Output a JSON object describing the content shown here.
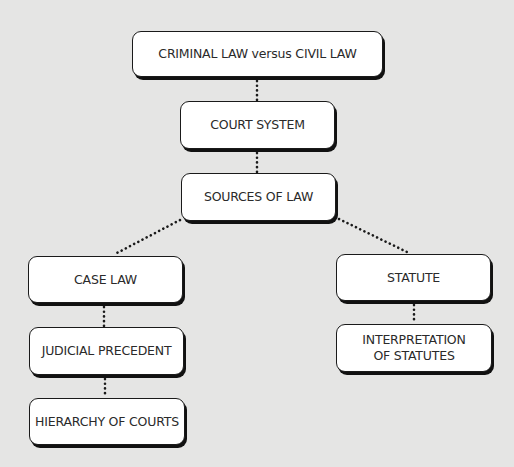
{
  "diagram": {
    "title": "",
    "background_color": "#e5e5e4",
    "node_fill": "#ffffff",
    "node_border": "#1a1a1a",
    "connector_color": "#1a1a1a",
    "connector_style": "dotted",
    "nodes": [
      {
        "id": "criminal-vs-civil",
        "label": "CRIMINAL LAW versus CIVIL LAW"
      },
      {
        "id": "court-system",
        "label": "COURT SYSTEM"
      },
      {
        "id": "sources-of-law",
        "label": "SOURCES OF LAW"
      },
      {
        "id": "case-law",
        "label": "CASE LAW"
      },
      {
        "id": "statute",
        "label": "STATUTE"
      },
      {
        "id": "judicial-precedent",
        "label": "JUDICIAL PRECEDENT"
      },
      {
        "id": "interpretation-of-statutes",
        "label_line1": "INTERPRETATION",
        "label_line2": "OF STATUTES"
      },
      {
        "id": "hierarchy-of-courts",
        "label": "HIERARCHY OF COURTS"
      }
    ],
    "edges": [
      {
        "from": "criminal-vs-civil",
        "to": "court-system"
      },
      {
        "from": "court-system",
        "to": "sources-of-law"
      },
      {
        "from": "sources-of-law",
        "to": "case-law"
      },
      {
        "from": "sources-of-law",
        "to": "statute"
      },
      {
        "from": "case-law",
        "to": "judicial-precedent"
      },
      {
        "from": "judicial-precedent",
        "to": "hierarchy-of-courts"
      },
      {
        "from": "statute",
        "to": "interpretation-of-statutes"
      }
    ]
  }
}
